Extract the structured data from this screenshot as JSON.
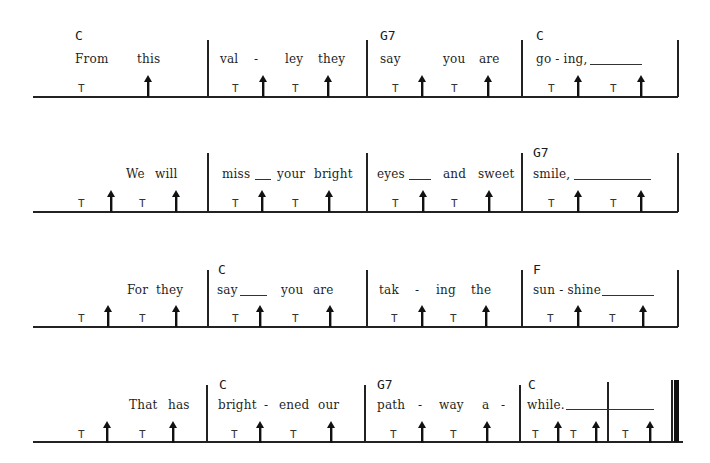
{
  "sheet": {
    "title": "",
    "legend": {
      "T": "thumb stroke",
      "arrow": "up-strum / brush"
    },
    "colors": {
      "ink": "#1a1a1a",
      "paper": "#ffffff"
    },
    "systems": [
      {
        "id": 1,
        "measures": [
          {
            "chord": "C",
            "lyrics": [
              "From",
              "this"
            ],
            "extender": false,
            "beats": [
              "T",
              "up",
              "",
              ""
            ]
          },
          {
            "chord": "",
            "lyrics": [
              "val",
              "-",
              "ley",
              "they"
            ],
            "extender": false,
            "beats": [
              "T",
              "up",
              "T",
              "up"
            ]
          },
          {
            "chord": "G7",
            "lyrics": [
              "say",
              "you",
              "are"
            ],
            "extender": false,
            "beats": [
              "T",
              "up",
              "T",
              "up"
            ]
          },
          {
            "chord": "C",
            "lyrics": [
              "go - ing,"
            ],
            "extender": true,
            "beats": [
              "T",
              "up",
              "T",
              "up"
            ]
          }
        ]
      },
      {
        "id": 2,
        "measures": [
          {
            "chord": "",
            "lyrics": [
              "We",
              "will"
            ],
            "extender": false,
            "beats": [
              "T",
              "up",
              "T",
              "up"
            ]
          },
          {
            "chord": "",
            "lyrics": [
              "miss",
              "your",
              "bright"
            ],
            "extender": true,
            "beats": [
              "T",
              "up",
              "T",
              "up"
            ]
          },
          {
            "chord": "",
            "lyrics": [
              "eyes",
              "and",
              "sweet"
            ],
            "extender": true,
            "beats": [
              "T",
              "up",
              "T",
              "up"
            ]
          },
          {
            "chord": "G7",
            "lyrics": [
              "smile,"
            ],
            "extender": true,
            "beats": [
              "T",
              "up",
              "T",
              "up"
            ]
          }
        ]
      },
      {
        "id": 3,
        "measures": [
          {
            "chord": "",
            "lyrics": [
              "For",
              "they"
            ],
            "extender": false,
            "beats": [
              "T",
              "up",
              "T",
              "up"
            ]
          },
          {
            "chord": "C",
            "lyrics": [
              "say",
              "you",
              "are"
            ],
            "extender": true,
            "beats": [
              "T",
              "up",
              "T",
              "up"
            ]
          },
          {
            "chord": "",
            "lyrics": [
              "tak",
              "-",
              "ing",
              "the"
            ],
            "extender": false,
            "beats": [
              "T",
              "up",
              "T",
              "up"
            ]
          },
          {
            "chord": "F",
            "lyrics": [
              "sun - shine"
            ],
            "extender": true,
            "beats": [
              "T",
              "up",
              "T",
              "up"
            ]
          }
        ]
      },
      {
        "id": 4,
        "measures": [
          {
            "chord": "",
            "lyrics": [
              "That",
              "has"
            ],
            "extender": false,
            "beats": [
              "T",
              "up",
              "T",
              "up"
            ]
          },
          {
            "chord": "C",
            "lyrics": [
              "bright",
              "-",
              "ened",
              "our"
            ],
            "extender": false,
            "beats": [
              "T",
              "up",
              "T",
              "up"
            ]
          },
          {
            "chord": "G7",
            "lyrics": [
              "path",
              "-",
              "way",
              "a",
              "-"
            ],
            "extender": false,
            "beats": [
              "T",
              "up",
              "T",
              "up"
            ]
          },
          {
            "chord": "C",
            "lyrics": [
              "while."
            ],
            "extender": true,
            "beats": [
              "T",
              "up",
              "T",
              "up"
            ]
          },
          {
            "chord": "",
            "lyrics": [],
            "extender": false,
            "beats": [
              "T",
              "up"
            ]
          }
        ]
      }
    ]
  },
  "text": {
    "s1": {
      "m1_chord": "C",
      "m1_w1": "From",
      "m1_w2": "this",
      "m2_w1": "val",
      "m2_w2": "-",
      "m2_w3": "ley",
      "m2_w4": "they",
      "m3_chord": "G7",
      "m3_w1": "say",
      "m3_w2": "you",
      "m3_w3": "are",
      "m4_chord": "C",
      "m4_w1": "go - ing,"
    },
    "s2": {
      "m1_w1": "We",
      "m1_w2": "will",
      "m2_w1": "miss",
      "m2_w2": "your",
      "m2_w3": "bright",
      "m3_w1": "eyes",
      "m3_w2": "and",
      "m3_w3": "sweet",
      "m4_chord": "G7",
      "m4_w1": "smile,"
    },
    "s3": {
      "m1_w1": "For",
      "m1_w2": "they",
      "m2_chord": "C",
      "m2_w1": "say",
      "m2_w2": "you",
      "m2_w3": "are",
      "m3_w1": "tak",
      "m3_w2": "-",
      "m3_w3": "ing",
      "m3_w4": "the",
      "m4_chord": "F",
      "m4_w1": "sun - shine"
    },
    "s4": {
      "m1_w1": "That",
      "m1_w2": "has",
      "m2_chord": "C",
      "m2_w1": "bright",
      "m2_w2": "-",
      "m2_w3": "ened",
      "m2_w4": "our",
      "m3_chord": "G7",
      "m3_w1": "path",
      "m3_w2": "-",
      "m3_w3": "way",
      "m3_w4": "a",
      "m3_w5": "-",
      "m4_chord": "C",
      "m4_w1": "while."
    },
    "thumb": "T"
  }
}
